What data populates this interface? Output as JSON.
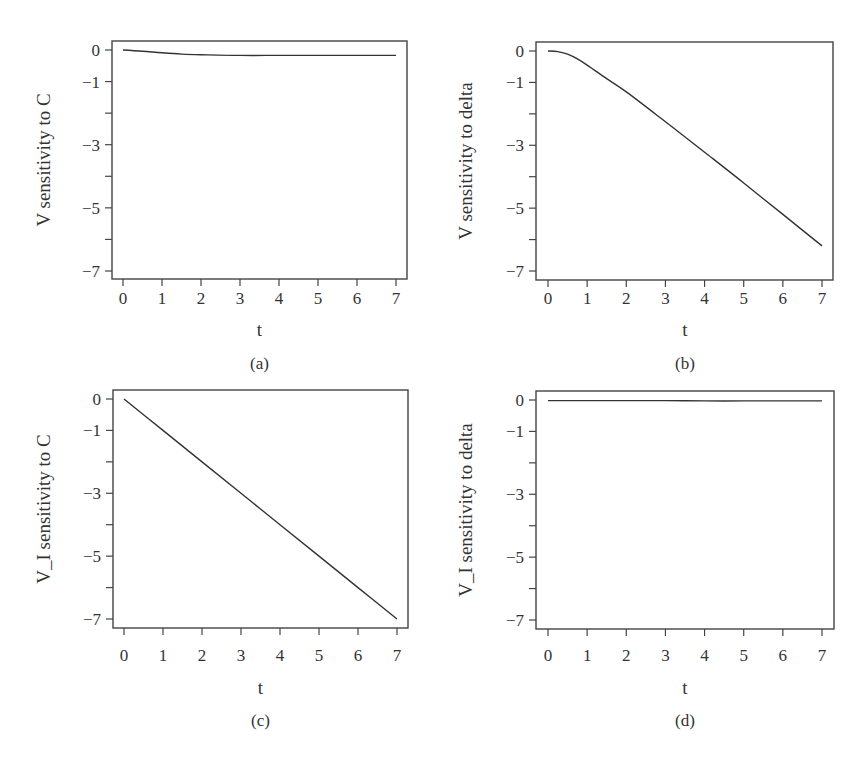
{
  "chart_data": [
    {
      "type": "line",
      "panel": "(a)",
      "title": "",
      "xlabel": "t",
      "ylabel": "V sensitivity to C",
      "xlim": [
        0,
        7
      ],
      "ylim": [
        -7,
        0
      ],
      "xticks": [
        "0",
        "1",
        "2",
        "3",
        "4",
        "5",
        "6",
        "7"
      ],
      "yticks": [
        "0",
        "-1",
        "",
        "-3",
        "",
        "-5",
        "",
        "-7"
      ],
      "grid": false,
      "x": [
        0,
        0.5,
        1,
        1.5,
        2,
        3,
        4,
        5,
        6,
        7
      ],
      "series": [
        {
          "name": "V sensitivity to C",
          "values": [
            0,
            -0.04,
            -0.09,
            -0.13,
            -0.15,
            -0.17,
            -0.17,
            -0.17,
            -0.17,
            -0.17
          ]
        }
      ]
    },
    {
      "type": "line",
      "panel": "(b)",
      "title": "",
      "xlabel": "t",
      "ylabel": "V sensitivity to delta",
      "xlim": [
        0,
        7
      ],
      "ylim": [
        -7,
        0
      ],
      "xticks": [
        "0",
        "1",
        "2",
        "3",
        "4",
        "5",
        "6",
        "7"
      ],
      "yticks": [
        "0",
        "-1",
        "",
        "-3",
        "",
        "-5",
        "",
        "-7"
      ],
      "grid": false,
      "x": [
        0,
        0.25,
        0.5,
        0.75,
        1,
        1.5,
        2,
        3,
        4,
        5,
        6,
        7
      ],
      "series": [
        {
          "name": "V sensitivity to delta",
          "values": [
            0,
            -0.02,
            -0.1,
            -0.25,
            -0.45,
            -0.88,
            -1.3,
            -2.25,
            -3.22,
            -4.2,
            -5.2,
            -6.2
          ]
        }
      ]
    },
    {
      "type": "line",
      "panel": "(c)",
      "title": "",
      "xlabel": "t",
      "ylabel": "V_I sensitivity to C",
      "xlim": [
        0,
        7
      ],
      "ylim": [
        -7,
        0
      ],
      "xticks": [
        "0",
        "1",
        "2",
        "3",
        "4",
        "5",
        "6",
        "7"
      ],
      "yticks": [
        "0",
        "-1",
        "",
        "-3",
        "",
        "-5",
        "",
        "-7"
      ],
      "grid": false,
      "x": [
        0,
        1,
        2,
        3,
        4,
        5,
        6,
        7
      ],
      "series": [
        {
          "name": "V_I sensitivity to C",
          "values": [
            0,
            -1,
            -2,
            -3,
            -4,
            -5,
            -6,
            -7
          ]
        }
      ]
    },
    {
      "type": "line",
      "panel": "(d)",
      "title": "",
      "xlabel": "t",
      "ylabel": "V_I sensitivity to delta",
      "xlim": [
        0,
        7
      ],
      "ylim": [
        -7,
        0
      ],
      "xticks": [
        "0",
        "1",
        "2",
        "3",
        "4",
        "5",
        "6",
        "7"
      ],
      "yticks": [
        "0",
        "-1",
        "",
        "-3",
        "",
        "-5",
        "",
        "-7"
      ],
      "grid": false,
      "x": [
        0,
        1,
        2,
        3,
        4,
        5,
        6,
        7
      ],
      "series": [
        {
          "name": "V_I sensitivity to delta",
          "values": [
            -0.02,
            -0.02,
            -0.02,
            -0.02,
            -0.03,
            -0.03,
            -0.03,
            -0.03
          ]
        }
      ]
    }
  ],
  "panels": [
    {
      "caption": "(a)",
      "xlabel": "t",
      "ylabel": "V sensitivity to C"
    },
    {
      "caption": "(b)",
      "xlabel": "t",
      "ylabel": "V sensitivity to delta"
    },
    {
      "caption": "(c)",
      "xlabel": "t",
      "ylabel": "V_I sensitivity to C"
    },
    {
      "caption": "(d)",
      "xlabel": "t",
      "ylabel": "V_I sensitivity to delta"
    }
  ],
  "colors": {
    "line": "#333333",
    "axis": "#444444",
    "background": "#ffffff"
  }
}
